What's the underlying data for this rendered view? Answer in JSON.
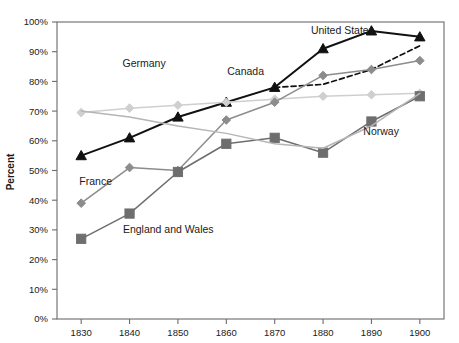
{
  "chart_data": {
    "type": "line",
    "title": "",
    "xlabel": "",
    "ylabel": "Percent",
    "x": [
      1830,
      1840,
      1850,
      1860,
      1870,
      1880,
      1890,
      1900
    ],
    "xlim": [
      1825,
      1905
    ],
    "ylim": [
      0,
      100
    ],
    "y_ticks": [
      0,
      10,
      20,
      30,
      40,
      50,
      60,
      70,
      80,
      90,
      100
    ],
    "y_tick_labels": [
      "0%",
      "10%",
      "20%",
      "30%",
      "40%",
      "50%",
      "60%",
      "70%",
      "80%",
      "90%",
      "100%"
    ],
    "x_tick_labels": [
      "1830",
      "1840",
      "1850",
      "1860",
      "1870",
      "1880",
      "1890",
      "1900"
    ],
    "grid": false,
    "legend": "inline-series-labels",
    "series": [
      {
        "name": "United States",
        "color": "#111111",
        "marker": "triangle",
        "dashed": false,
        "label_x": 1884,
        "label_y": 96,
        "x": [
          1830,
          1840,
          1850,
          1860,
          1870,
          1880,
          1890,
          1900
        ],
        "values": [
          55,
          61,
          68,
          73,
          78,
          91,
          97,
          95
        ]
      },
      {
        "name": "Canada",
        "color": "#111111",
        "marker": "none",
        "dashed": true,
        "label_x": 1864,
        "label_y": 82,
        "x": [
          1870,
          1880,
          1890,
          1900
        ],
        "values": [
          78,
          79,
          84,
          92
        ]
      },
      {
        "name": "Germany",
        "color": "#cfcfcf",
        "marker": "diamond",
        "dashed": false,
        "label_x": 1843,
        "label_y": 85,
        "x": [
          1830,
          1840,
          1850,
          1860,
          1870,
          1880,
          1890,
          1900
        ],
        "values": [
          69.5,
          71,
          72,
          73,
          74,
          75,
          75.5,
          76
        ]
      },
      {
        "name": "France",
        "color": "#8c8c8c",
        "marker": "diamond",
        "dashed": false,
        "label_x": 1833,
        "label_y": 45,
        "x": [
          1830,
          1840,
          1850,
          1860,
          1870,
          1880,
          1890,
          1900
        ],
        "values": [
          39,
          51,
          50,
          67,
          73,
          82,
          84,
          87
        ]
      },
      {
        "name": "England and Wales",
        "color": "#6e6e6e",
        "marker": "square",
        "dashed": false,
        "label_x": 1848,
        "label_y": 29,
        "x": [
          1830,
          1840,
          1850,
          1860,
          1870,
          1880,
          1890,
          1900
        ],
        "values": [
          27,
          35.5,
          49.5,
          59,
          61,
          56,
          66.5,
          75
        ]
      },
      {
        "name": "Norway",
        "color": "#b5b5b5",
        "marker": "none",
        "dashed": false,
        "label_x": 1892,
        "label_y": 62,
        "x": [
          1830,
          1840,
          1850,
          1860,
          1870,
          1880,
          1890,
          1900
        ],
        "values": [
          70,
          68,
          65,
          62.5,
          59,
          57.5,
          65,
          76
        ]
      }
    ]
  },
  "axes": {
    "y_title": "Percent"
  },
  "colors": {
    "frame": "#6b6b6b",
    "text": "#1a1a1a",
    "background": "#ffffff"
  }
}
